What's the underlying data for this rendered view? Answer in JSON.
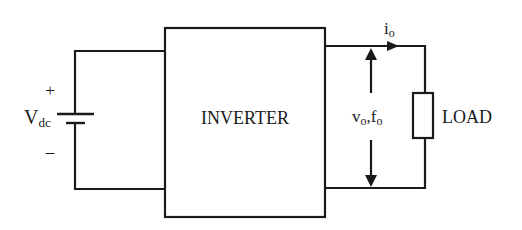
{
  "diagram": {
    "type": "inverter-block-diagram",
    "source": {
      "label_main": "V",
      "label_sub": "dc",
      "plus_sign": "+",
      "minus_sign": "–"
    },
    "inverter": {
      "label": "INVERTER"
    },
    "output": {
      "current_main": "i",
      "current_sub": "o",
      "voltage_main_1": "v",
      "voltage_sub_1": "o",
      "voltage_sep": ",",
      "voltage_main_2": "f",
      "voltage_sub_2": "o"
    },
    "load": {
      "label": "LOAD"
    },
    "colors": {
      "line": "#1a1a1a",
      "background": "#ffffff"
    }
  }
}
